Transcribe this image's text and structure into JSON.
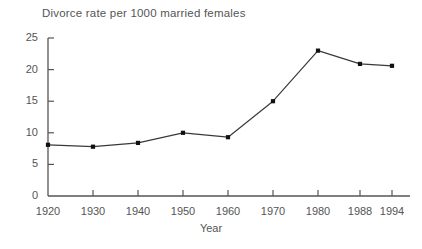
{
  "chart_data": {
    "type": "line",
    "title": "Divorce rate per 1000 married females",
    "xlabel": "Year",
    "ylabel": "",
    "categories": [
      "1920",
      "1930",
      "1940",
      "1950",
      "1960",
      "1970",
      "1980",
      "1988",
      "1994"
    ],
    "values": [
      8.1,
      7.8,
      8.4,
      10.0,
      9.3,
      15.0,
      23.0,
      20.9,
      20.6
    ],
    "ylim": [
      0,
      25
    ],
    "yticks": [
      "0",
      "5",
      "10",
      "15",
      "20",
      "25"
    ],
    "ytick_values": [
      0,
      5,
      10,
      15,
      20,
      25
    ],
    "grid": false,
    "legend": "none",
    "marker": "square",
    "line_color": "#3a3a3a",
    "marker_color": "#111111",
    "axis_color": "#555555",
    "background": "#ffffff"
  }
}
